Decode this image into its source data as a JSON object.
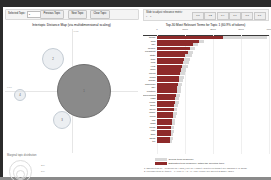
{
  "app": {
    "name": "LDAvis",
    "accent_selected": "#8e2a2a",
    "accent_overall": "#d8d8d8",
    "bubble_selected": "#8a8a8a",
    "bubble_unselected": "#dce2e8"
  },
  "toolbar": {
    "selected_topic_label": "Selected Topic:",
    "selected_topic_value": "1",
    "previous_topic": "Previous Topic",
    "next_topic": "Next Topic",
    "clear_topic": "Clear Topic"
  },
  "left": {
    "map_title": "Intertopic Distance Map (via multidimensional scaling)",
    "axis_x_label": "PC1",
    "axis_y_label": "PC2",
    "marginal_title": "Marginal topic distribution",
    "ring_labels": [
      "2%",
      "5%",
      "10%"
    ],
    "topics": [
      {
        "id": "1",
        "x": 79,
        "y": 62,
        "r": 27,
        "selected": true
      },
      {
        "id": "2",
        "x": 48,
        "y": 30,
        "r": 11,
        "selected": false
      },
      {
        "id": "3",
        "x": 57,
        "y": 91,
        "r": 9,
        "selected": false
      },
      {
        "id": "4",
        "x": 15,
        "y": 66,
        "r": 6,
        "selected": false
      }
    ]
  },
  "right": {
    "slider_label": "Slide to adjust relevance metric:",
    "slider_sublabel": "λ = 1",
    "slider_ticks": [
      "0.0",
      "0.2",
      "0.4",
      "0.6",
      "0.8",
      "1.0"
    ],
    "bar_title": "Top-30 Most Relevant Terms for Topic 1 (60.9% of tokens)",
    "legend_overall": "Overall term frequency",
    "legend_topic": "Estimated term frequency within the selected topic",
    "note_1": "1. saliency(term w) = frequency(w) * [sum_t p(t | w) * log(p(t | w)/p(t))] for topics t; see Chuang et. al (2012)",
    "note_2": "2. relevance(term w | topic t) = λ * p(w | t) + (1 - λ) * p(w | t)/p(w); see Sievert & Shirley (2014)"
  },
  "chart_data": {
    "type": "bar",
    "title": "Top-30 Most Relevant Terms for Topic 1 (60.9% of tokens)",
    "xlabel": "",
    "ylabel": "",
    "xlim": [
      0,
      4000
    ],
    "xticks": [
      0,
      1000,
      2000,
      3000,
      4000
    ],
    "grid": true,
    "legend_position": "bottom",
    "categories": [
      "trump",
      "said",
      "say",
      "people",
      "president",
      "state",
      "time",
      "new",
      "year",
      "work",
      "report",
      "news",
      "house",
      "american",
      "day",
      "election",
      "government",
      "right",
      "come",
      "think",
      "week",
      "make",
      "need",
      "call",
      "want",
      "know",
      "vote",
      "take",
      "show",
      "tell"
    ],
    "series": [
      {
        "name": "Overall term frequency",
        "values": [
          3920,
          1680,
          1480,
          1360,
          1300,
          1240,
          1180,
          1140,
          1090,
          1040,
          1000,
          960,
          930,
          900,
          870,
          840,
          815,
          790,
          770,
          745,
          720,
          700,
          680,
          660,
          640,
          620,
          600,
          580,
          560,
          540
        ]
      },
      {
        "name": "Estimated term frequency within the selected topic",
        "values": [
          2360,
          1500,
          1300,
          1180,
          1120,
          1000,
          980,
          930,
          900,
          860,
          830,
          790,
          770,
          740,
          720,
          700,
          680,
          660,
          640,
          620,
          600,
          580,
          560,
          545,
          530,
          515,
          500,
          485,
          470,
          455
        ]
      }
    ]
  }
}
